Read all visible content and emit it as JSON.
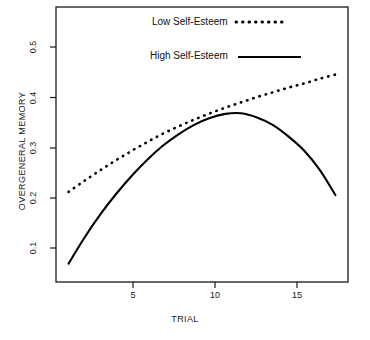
{
  "chart_data": {
    "type": "line",
    "title": "",
    "xlabel": "TRIAL",
    "ylabel": "OVERGENERAL MEMORY",
    "xlim": [
      0.2,
      18.8
    ],
    "ylim": [
      0.02,
      0.545
    ],
    "xticks": [
      5,
      10,
      15
    ],
    "xticklabels": [
      "5",
      "10",
      "15"
    ],
    "yticks": [
      0.1,
      0.2,
      0.3,
      0.4,
      0.5
    ],
    "yticklabels": [
      "0.1",
      "0.2",
      "0.3",
      "0.4",
      "0.5"
    ],
    "grid": false,
    "legend_position": "top-center",
    "x": [
      1,
      2,
      3,
      4,
      5,
      6,
      7,
      8,
      9,
      10,
      11,
      12,
      13,
      14,
      15,
      16,
      17,
      18
    ],
    "series": [
      {
        "name": "Low Self-Esteem",
        "style": "dotted",
        "color": "#000000",
        "values": [
          0.192,
          0.213,
          0.233,
          0.252,
          0.27,
          0.287,
          0.303,
          0.317,
          0.33,
          0.342,
          0.353,
          0.363,
          0.373,
          0.382,
          0.391,
          0.399,
          0.408,
          0.416
        ]
      },
      {
        "name": "High Self-Esteem",
        "style": "solid",
        "color": "#000000",
        "values": [
          0.055,
          0.104,
          0.148,
          0.187,
          0.222,
          0.253,
          0.28,
          0.302,
          0.32,
          0.333,
          0.341,
          0.342,
          0.334,
          0.32,
          0.298,
          0.271,
          0.234,
          0.186
        ]
      }
    ]
  },
  "legend": {
    "entries": [
      {
        "label": "Low Self-Esteem",
        "style": "dotted"
      },
      {
        "label": "High Self-Esteem",
        "style": "solid"
      }
    ]
  },
  "axes": {
    "x_axis_title": "TRIAL",
    "y_axis_title": "OVERGENERAL MEMORY",
    "x_tick_0": "5",
    "x_tick_1": "10",
    "x_tick_2": "15",
    "y_tick_0": "0.1",
    "y_tick_1": "0.2",
    "y_tick_2": "0.3",
    "y_tick_3": "0.4",
    "y_tick_4": "0.5"
  }
}
